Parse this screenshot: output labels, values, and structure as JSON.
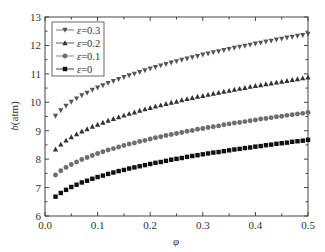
{
  "chart_data": {
    "type": "scatter",
    "title": "",
    "xlabel": "φ",
    "ylabel_var": "b",
    "ylabel_unit": "(atm)",
    "xlim": [
      0.0,
      0.5
    ],
    "ylim": [
      6,
      13
    ],
    "x_ticks": [
      0.0,
      0.1,
      0.2,
      0.3,
      0.4,
      0.5
    ],
    "x_tick_labels": [
      "0.0",
      "0.1",
      "0.2",
      "0.3",
      "0.4",
      "0.5"
    ],
    "x_minor_ticks": [
      0.05,
      0.15,
      0.25,
      0.35,
      0.45
    ],
    "y_ticks": [
      6,
      7,
      8,
      9,
      10,
      11,
      12,
      13
    ],
    "y_tick_labels": [
      "6",
      "7",
      "8",
      "9",
      "10",
      "11",
      "12",
      "13"
    ],
    "y_minor_ticks": [
      6.5,
      7.5,
      8.5,
      9.5,
      10.5,
      11.5,
      12.5
    ],
    "grid": false,
    "legend_position": "top-left",
    "x": [
      0.02,
      0.03,
      0.04,
      0.05,
      0.06,
      0.07,
      0.08,
      0.09,
      0.1,
      0.11,
      0.12,
      0.13,
      0.14,
      0.15,
      0.16,
      0.17,
      0.18,
      0.19,
      0.2,
      0.21,
      0.22,
      0.23,
      0.24,
      0.25,
      0.26,
      0.27,
      0.28,
      0.29,
      0.3,
      0.31,
      0.32,
      0.33,
      0.34,
      0.35,
      0.36,
      0.37,
      0.38,
      0.39,
      0.4,
      0.41,
      0.42,
      0.43,
      0.44,
      0.45,
      0.46,
      0.47,
      0.48,
      0.49,
      0.5
    ],
    "series": [
      {
        "name": "ε=0.3",
        "legend_symbol": "ε",
        "legend_value": "=0.3",
        "marker": "triangle-down",
        "color": "#555555",
        "values": [
          9.52,
          9.71,
          9.87,
          10.01,
          10.13,
          10.24,
          10.33,
          10.43,
          10.51,
          10.59,
          10.67,
          10.74,
          10.81,
          10.88,
          10.94,
          11.0,
          11.06,
          11.12,
          11.18,
          11.23,
          11.29,
          11.34,
          11.39,
          11.44,
          11.49,
          11.53,
          11.58,
          11.62,
          11.67,
          11.71,
          11.75,
          11.79,
          11.83,
          11.87,
          11.91,
          11.95,
          11.98,
          12.02,
          12.06,
          12.09,
          12.13,
          12.16,
          12.2,
          12.23,
          12.27,
          12.3,
          12.33,
          12.36,
          12.4
        ]
      },
      {
        "name": "ε=0.2",
        "legend_symbol": "ε",
        "legend_value": "=0.2",
        "marker": "triangle-up",
        "color": "#333333",
        "values": [
          8.35,
          8.52,
          8.66,
          8.78,
          8.88,
          8.98,
          9.06,
          9.15,
          9.22,
          9.29,
          9.36,
          9.42,
          9.48,
          9.54,
          9.6,
          9.65,
          9.71,
          9.76,
          9.81,
          9.86,
          9.9,
          9.95,
          9.99,
          10.03,
          10.08,
          10.12,
          10.16,
          10.2,
          10.23,
          10.27,
          10.31,
          10.34,
          10.38,
          10.41,
          10.45,
          10.48,
          10.51,
          10.55,
          10.58,
          10.61,
          10.64,
          10.67,
          10.7,
          10.73,
          10.76,
          10.79,
          10.82,
          10.85,
          10.88
        ]
      },
      {
        "name": "ε=0.1",
        "legend_symbol": "ε",
        "legend_value": "=0.1",
        "marker": "circle",
        "color": "#6e6e6e",
        "values": [
          7.44,
          7.59,
          7.71,
          7.81,
          7.9,
          7.99,
          8.06,
          8.13,
          8.2,
          8.26,
          8.32,
          8.37,
          8.43,
          8.48,
          8.53,
          8.57,
          8.62,
          8.66,
          8.71,
          8.75,
          8.79,
          8.83,
          8.87,
          8.9,
          8.94,
          8.98,
          9.01,
          9.05,
          9.08,
          9.11,
          9.14,
          9.17,
          9.21,
          9.24,
          9.27,
          9.29,
          9.32,
          9.35,
          9.38,
          9.41,
          9.43,
          9.46,
          9.49,
          9.51,
          9.54,
          9.56,
          9.59,
          9.61,
          9.64
        ]
      },
      {
        "name": "ε=0",
        "legend_symbol": "ε",
        "legend_value": "=0",
        "marker": "square",
        "color": "#111111",
        "values": [
          6.68,
          6.81,
          6.92,
          7.02,
          7.1,
          7.18,
          7.24,
          7.31,
          7.37,
          7.42,
          7.48,
          7.53,
          7.58,
          7.62,
          7.67,
          7.71,
          7.75,
          7.79,
          7.83,
          7.87,
          7.9,
          7.94,
          7.98,
          8.01,
          8.04,
          8.08,
          8.11,
          8.14,
          8.17,
          8.2,
          8.23,
          8.25,
          8.28,
          8.31,
          8.34,
          8.36,
          8.39,
          8.41,
          8.44,
          8.46,
          8.49,
          8.51,
          8.54,
          8.56,
          8.58,
          8.61,
          8.63,
          8.65,
          8.68
        ]
      }
    ]
  }
}
